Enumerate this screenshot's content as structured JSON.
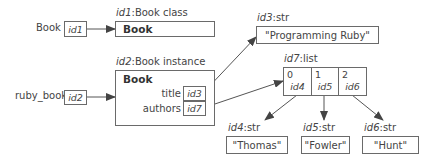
{
  "diagram": {
    "variables": [
      {
        "name": "Book",
        "ref": "id1"
      },
      {
        "name": "ruby_book",
        "ref": "id2"
      }
    ],
    "objects": {
      "class_obj": {
        "id": "id1",
        "type": "Book class",
        "header": "Book"
      },
      "instance_obj": {
        "id": "id2",
        "type": "Book instance",
        "header": "Book",
        "fields": [
          {
            "name": "title",
            "ref": "id3"
          },
          {
            "name": "authors",
            "ref": "id7"
          }
        ]
      },
      "title_str": {
        "id": "id3",
        "type": "str",
        "value": "\"Programming Ruby\""
      },
      "authors_list": {
        "id": "id7",
        "type": "list",
        "cells": [
          {
            "index": "0",
            "ref": "id4"
          },
          {
            "index": "1",
            "ref": "id5"
          },
          {
            "index": "2",
            "ref": "id6"
          }
        ]
      },
      "strings": [
        {
          "id": "id4",
          "type": "str",
          "value": "\"Thomas\""
        },
        {
          "id": "id5",
          "type": "str",
          "value": "\"Fowler\""
        },
        {
          "id": "id6",
          "type": "str",
          "value": "\"Hunt\""
        }
      ]
    },
    "colors": {
      "line": "#6a6a6a",
      "text": "#444444",
      "arrow": "#555555"
    }
  }
}
